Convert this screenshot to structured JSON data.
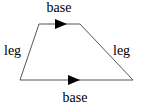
{
  "diagram": {
    "type": "trapezoid",
    "labels": {
      "top": "base",
      "bottom": "base",
      "left": "leg",
      "right": "leg"
    },
    "vertices": {
      "top_left": [
        39,
        24
      ],
      "top_right": [
        80,
        24
      ],
      "bottom_right": [
        133,
        80
      ],
      "bottom_left": [
        20,
        80
      ]
    },
    "parallel_markers": [
      "top",
      "bottom"
    ],
    "colors": {
      "stroke": "#555555",
      "arrow": "#000000",
      "text": "#000000"
    }
  }
}
